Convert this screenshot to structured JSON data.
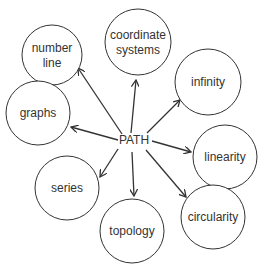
{
  "diagram": {
    "center": {
      "label": "PATH",
      "x": 134,
      "y": 144
    },
    "colors": {
      "stroke": "#333333",
      "text": "#333333",
      "background": "#ffffff"
    },
    "nodes": [
      {
        "id": "number-line",
        "lines": [
          "number",
          "line"
        ],
        "cx": 52,
        "cy": 55,
        "r": 30,
        "arrow_to": [
          78,
          68
        ]
      },
      {
        "id": "coordinate-systems",
        "lines": [
          "coordinate",
          "systems"
        ],
        "cx": 138,
        "cy": 42,
        "r": 33,
        "arrow_to": [
          136,
          80
        ]
      },
      {
        "id": "infinity",
        "lines": [
          "infinity"
        ],
        "cx": 208,
        "cy": 82,
        "r": 33,
        "arrow_to": [
          180,
          100
        ]
      },
      {
        "id": "graphs",
        "lines": [
          "graphs"
        ],
        "cx": 38,
        "cy": 113,
        "r": 32,
        "arrow_to": [
          71,
          127
        ]
      },
      {
        "id": "linearity",
        "lines": [
          "linearity"
        ],
        "cx": 225,
        "cy": 157,
        "r": 32,
        "arrow_to": [
          191,
          152
        ]
      },
      {
        "id": "series",
        "lines": [
          "series"
        ],
        "cx": 67,
        "cy": 188,
        "r": 32,
        "arrow_to": [
          100,
          177
        ]
      },
      {
        "id": "topology",
        "lines": [
          "topology"
        ],
        "cx": 132,
        "cy": 231,
        "r": 32,
        "arrow_to": [
          134,
          196
        ]
      },
      {
        "id": "circularity",
        "lines": [
          "circularity"
        ],
        "cx": 213,
        "cy": 217,
        "r": 32,
        "arrow_to": [
          186,
          197
        ]
      }
    ],
    "arrow_from": {
      "number-line": [
        122,
        134
      ],
      "coordinate-systems": [
        131,
        133
      ],
      "infinity": [
        147,
        133
      ],
      "graphs": [
        118,
        140
      ],
      "linearity": [
        152,
        141
      ],
      "series": [
        118,
        149
      ],
      "topology": [
        132,
        152
      ],
      "circularity": [
        146,
        150
      ]
    }
  }
}
